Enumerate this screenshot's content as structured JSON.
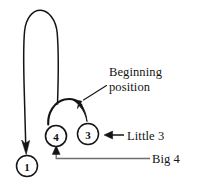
{
  "figure": {
    "type": "handwriting-stroke-diagram",
    "background_color": "#ffffff",
    "ink_color": "#141414",
    "guide_color": "#6e6e6e"
  },
  "nodes": [
    {
      "id": "node-1",
      "label": "1",
      "cx": 27,
      "cy": 166,
      "r": 10.5,
      "meaning": "stroke order point one"
    },
    {
      "id": "node-4",
      "label": "4",
      "cx": 56,
      "cy": 136,
      "r": 10.5,
      "meaning": "stroke order point four"
    },
    {
      "id": "node-3",
      "label": "3",
      "cx": 88,
      "cy": 134,
      "r": 10.5,
      "meaning": "stroke order point three"
    }
  ],
  "annotations": {
    "beginning_position": {
      "line_1": "Beginning",
      "line_2": "position",
      "points_to": "node-3 arc apex"
    },
    "little_3": {
      "text": "Little 3",
      "points_to": "node-3"
    },
    "big_4": {
      "text": "Big 4",
      "points_to": "node-4"
    }
  },
  "strokes": [
    {
      "id": "big-loop",
      "description": "Tall inverted-U loop descending into node 1 with arrowhead"
    },
    {
      "id": "small-arc",
      "description": "Arc from node 4 rising and curving down into node 3"
    },
    {
      "id": "big-4-leader",
      "description": "Horizontal leader line turning up into node 4 with arrowhead"
    },
    {
      "id": "little-3-leader",
      "description": "Horizontal leader line with left arrowhead pointing at node 3"
    },
    {
      "id": "beginning-position-leader",
      "description": "Diagonal leader line from text down-left to arc apex arrowhead"
    }
  ]
}
